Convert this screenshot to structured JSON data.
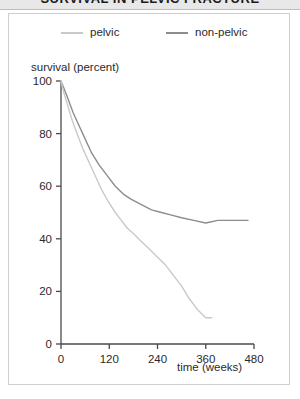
{
  "title": {
    "text": "SURVIVAL IN PELVIC FRACTURE",
    "clipped": true
  },
  "legend": {
    "position": "top",
    "entries": [
      {
        "label": "pelvic",
        "color": "#c9c9c9",
        "swatch_name": "legend-line-pelvic"
      },
      {
        "label": "non-pelvic",
        "color": "#8d8d8d",
        "swatch_name": "legend-line-non-pelvic"
      }
    ]
  },
  "axes": {
    "y_title": "survival (percent)",
    "x_title": "time (weeks)",
    "y_ticks": [
      "0",
      "20",
      "40",
      "60",
      "80",
      "100"
    ],
    "x_ticks": [
      "0",
      "120",
      "240",
      "360",
      "480"
    ]
  },
  "chart_data": {
    "type": "line",
    "title": "SURVIVAL IN PELVIC FRACTURE",
    "xlabel": "time (weeks)",
    "ylabel": "survival (percent)",
    "xlim": [
      0,
      480
    ],
    "ylim": [
      0,
      100
    ],
    "xticks": [
      0,
      120,
      240,
      360,
      480
    ],
    "yticks": [
      0,
      20,
      40,
      60,
      80,
      100
    ],
    "grid": false,
    "legend_position": "top",
    "series": [
      {
        "name": "non-pelvic",
        "color": "#8d8d8d",
        "x": [
          0,
          8,
          18,
          30,
          45,
          60,
          75,
          95,
          115,
          135,
          155,
          175,
          200,
          225,
          250,
          275,
          300,
          330,
          360,
          390,
          420,
          465
        ],
        "y": [
          100,
          97,
          93,
          88,
          83,
          78,
          73,
          68,
          64,
          60,
          57,
          55,
          53,
          51,
          50,
          49,
          48,
          47,
          46,
          47,
          47,
          47
        ]
      },
      {
        "name": "pelvic",
        "color": "#c9c9c9",
        "x": [
          0,
          8,
          18,
          28,
          40,
          55,
          70,
          85,
          100,
          118,
          135,
          150,
          165,
          180,
          200,
          220,
          240,
          260,
          280,
          300,
          320,
          340,
          360,
          375
        ],
        "y": [
          100,
          95,
          90,
          85,
          80,
          74,
          69,
          64,
          59,
          54,
          50,
          47,
          44,
          42,
          39,
          36,
          33,
          30,
          26,
          22,
          17,
          13,
          10,
          10
        ]
      }
    ]
  }
}
